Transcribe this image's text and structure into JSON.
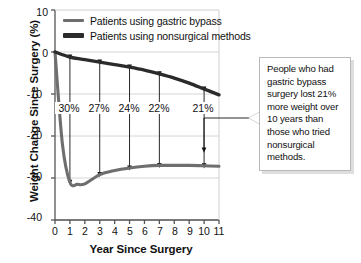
{
  "chart_data": {
    "type": "line",
    "title": "",
    "xlabel": "Year Since Surgery",
    "ylabel": "Weight Change Since Surgery (%)",
    "xlim": [
      0,
      11
    ],
    "ylim": [
      -40,
      10
    ],
    "xticks": [
      "0",
      "1",
      "2",
      "3",
      "4",
      "5",
      "6",
      "7",
      "8",
      "9",
      "10",
      "11"
    ],
    "yticks": [
      "10",
      "0",
      "-10",
      "-20",
      "-30",
      "-40"
    ],
    "grid": true,
    "legend_position": "top-center",
    "series": [
      {
        "name": "Patients using gastric bypass",
        "color": "#6e6e6e",
        "x": [
          0,
          0.5,
          1,
          1.5,
          2,
          3,
          4,
          5,
          6,
          7,
          8,
          9,
          10,
          11
        ],
        "values": [
          0,
          -22,
          -31,
          -31.5,
          -31.4,
          -29.2,
          -28.2,
          -27.6,
          -27.2,
          -27.0,
          -27.0,
          -27.0,
          -27.1,
          -27.2
        ]
      },
      {
        "name": "Patients using nonsurgical methods",
        "color": "#2b2b2b",
        "x": [
          0,
          1,
          2,
          3,
          4,
          5,
          6,
          7,
          8,
          9,
          10,
          11
        ],
        "values": [
          0,
          -1.2,
          -1.8,
          -2.4,
          -3.0,
          -3.6,
          -4.3,
          -5.2,
          -6.2,
          -7.4,
          -8.8,
          -10.2
        ]
      }
    ],
    "gap_annotations": [
      {
        "x": 1,
        "label": "30%",
        "top": -1.2,
        "bottom": -31.0
      },
      {
        "x": 3,
        "label": "27%",
        "top": -2.4,
        "bottom": -29.2
      },
      {
        "x": 5,
        "label": "24%",
        "top": -3.6,
        "bottom": -27.6
      },
      {
        "x": 7,
        "label": "22%",
        "top": -5.2,
        "bottom": -27.0
      },
      {
        "x": 10,
        "label": "21%",
        "top": -8.8,
        "bottom": -27.1
      }
    ],
    "annotation": {
      "lines": [
        "People who had",
        "gastric bypass",
        "surgery lost 21%",
        "more weight",
        "over 10 years",
        "than those who",
        "tried nonsurgical",
        "methods."
      ]
    }
  }
}
